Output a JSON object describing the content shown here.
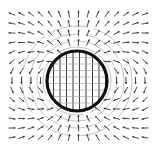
{
  "diagram": {
    "title": "",
    "description_type": "vector field around a circular body",
    "colors": {
      "background": "#ffffff",
      "circle": "#111111",
      "arrows": "#333333",
      "field_lines": "#9a9a9a"
    },
    "circle": {
      "cx": 77,
      "cy": 81,
      "r": 30,
      "stroke_width": 3.2
    },
    "grid": {
      "x_start": 12,
      "x_end": 146,
      "y_start": 14,
      "y_end": 146,
      "spacing": 9.5
    },
    "arrow_length": 7,
    "field": {
      "outside": "dipole (upward moment, curving outward above, looping below)",
      "inside": "uniform vertical",
      "moment_direction": [
        0,
        -1
      ]
    },
    "interior_mesh": {
      "spacing": 6.5
    },
    "contour_radii": [
      34,
      40,
      47,
      55
    ]
  }
}
